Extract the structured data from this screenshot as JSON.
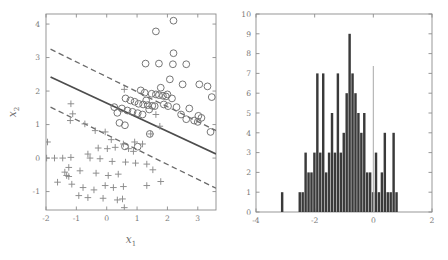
{
  "figure": {
    "background": "#ffffff",
    "panel_count": 2
  },
  "chart_data": [
    {
      "type": "scatter",
      "panel": "left",
      "title": "",
      "xlabel": "x1",
      "ylabel": "x2",
      "xlim": [
        -2,
        3.6
      ],
      "ylim": [
        -1.55,
        4.3
      ],
      "xticks": [
        -2,
        -1,
        0,
        1,
        2,
        3
      ],
      "xtick_labels": [
        "-2",
        "-1",
        "0",
        "1",
        "2",
        "3"
      ],
      "yticks": [
        -1,
        0,
        1,
        2,
        3,
        4
      ],
      "ytick_labels": [
        "-1",
        "0",
        "1",
        "2",
        "3",
        "4"
      ],
      "grid": false,
      "legend": null,
      "series": [
        {
          "name": "class-circle",
          "marker": "circle",
          "color": "#6f6f6f",
          "points": [
            [
              2.2,
              4.1
            ],
            [
              1.62,
              3.78
            ],
            [
              2.2,
              3.13
            ],
            [
              1.28,
              2.82
            ],
            [
              1.72,
              2.82
            ],
            [
              2.18,
              2.8
            ],
            [
              2.62,
              2.8
            ],
            [
              2.08,
              2.35
            ],
            [
              2.5,
              2.2
            ],
            [
              3.05,
              2.2
            ],
            [
              3.32,
              2.14
            ],
            [
              1.78,
              2.1
            ],
            [
              1.12,
              2.02
            ],
            [
              1.25,
              1.95
            ],
            [
              1.48,
              1.92
            ],
            [
              1.62,
              1.9
            ],
            [
              1.72,
              1.88
            ],
            [
              1.85,
              1.86
            ],
            [
              1.95,
              1.84
            ],
            [
              2.0,
              1.9
            ],
            [
              3.46,
              1.82
            ],
            [
              0.62,
              1.78
            ],
            [
              0.78,
              1.72
            ],
            [
              0.92,
              1.68
            ],
            [
              1.05,
              1.62
            ],
            [
              1.2,
              1.6
            ],
            [
              1.35,
              1.58
            ],
            [
              1.5,
              1.56
            ],
            [
              2.3,
              1.52
            ],
            [
              2.72,
              1.48
            ],
            [
              0.5,
              1.48
            ],
            [
              0.68,
              1.42
            ],
            [
              0.85,
              1.38
            ],
            [
              1.02,
              1.34
            ],
            [
              1.18,
              1.3
            ],
            [
              2.45,
              1.3
            ],
            [
              3.02,
              1.26
            ],
            [
              3.12,
              1.2
            ],
            [
              2.62,
              1.16
            ],
            [
              2.88,
              1.12
            ],
            [
              3.0,
              1.08
            ],
            [
              0.42,
              1.05
            ],
            [
              0.6,
              0.98
            ],
            [
              3.42,
              0.78
            ],
            [
              1.42,
              0.72
            ],
            [
              0.6,
              0.35
            ],
            [
              1.02,
              0.34
            ],
            [
              0.25,
              1.52
            ],
            [
              0.35,
              1.35
            ],
            [
              1.58,
              1.55
            ],
            [
              1.88,
              1.6
            ],
            [
              2.02,
              1.55
            ],
            [
              2.15,
              1.78
            ],
            [
              1.4,
              1.45
            ],
            [
              1.3,
              1.72
            ]
          ]
        },
        {
          "name": "class-plus",
          "marker": "plus",
          "color": "#8a8a8a",
          "points": [
            [
              0.58,
              2.05
            ],
            [
              -1.18,
              1.62
            ],
            [
              -1.12,
              1.32
            ],
            [
              -1.2,
              1.12
            ],
            [
              -0.72,
              1.02
            ],
            [
              -0.38,
              0.82
            ],
            [
              -0.05,
              0.78
            ],
            [
              1.62,
              1.3
            ],
            [
              1.75,
              0.95
            ],
            [
              1.45,
              0.72
            ],
            [
              -1.95,
              0.48
            ],
            [
              -1.98,
              0.0
            ],
            [
              -1.72,
              0.0
            ],
            [
              -1.45,
              0.0
            ],
            [
              -1.18,
              0.02
            ],
            [
              -0.62,
              0.12
            ],
            [
              -0.28,
              0.3
            ],
            [
              0.02,
              0.28
            ],
            [
              0.28,
              0.32
            ],
            [
              0.55,
              0.42
            ],
            [
              0.72,
              0.28
            ],
            [
              0.88,
              0.2
            ],
            [
              -0.55,
              0.0
            ],
            [
              -0.22,
              -0.02
            ],
            [
              0.18,
              -0.1
            ],
            [
              0.62,
              -0.12
            ],
            [
              0.95,
              -0.15
            ],
            [
              1.32,
              -0.18
            ],
            [
              1.52,
              -0.35
            ],
            [
              -1.38,
              -0.42
            ],
            [
              -1.32,
              -0.52
            ],
            [
              -1.25,
              -0.55
            ],
            [
              -0.88,
              -0.38
            ],
            [
              -0.35,
              -0.45
            ],
            [
              0.05,
              -0.52
            ],
            [
              0.38,
              -0.48
            ],
            [
              -1.62,
              -0.72
            ],
            [
              -1.15,
              -0.78
            ],
            [
              -0.78,
              -0.88
            ],
            [
              -0.42,
              -0.95
            ],
            [
              -0.05,
              -0.82
            ],
            [
              0.22,
              -0.88
            ],
            [
              0.55,
              -0.85
            ],
            [
              1.32,
              -0.82
            ],
            [
              1.78,
              -0.7
            ],
            [
              -0.92,
              -1.12
            ],
            [
              -0.62,
              -1.18
            ],
            [
              -0.12,
              -1.2
            ],
            [
              0.35,
              -1.25
            ],
            [
              0.52,
              -1.22
            ],
            [
              0.58,
              -1.48
            ],
            [
              -1.25,
              -0.28
            ],
            [
              0.15,
              0.55
            ],
            [
              0.92,
              0.48
            ],
            [
              1.18,
              0.42
            ]
          ]
        }
      ],
      "lines": [
        {
          "name": "decision-boundary",
          "style": "solid",
          "color": "#4d4d4d",
          "from": [
            -1.85,
            2.42
          ],
          "to": [
            3.6,
            0.12
          ]
        },
        {
          "name": "upper-margin",
          "style": "dashed",
          "color": "#6a6a6a",
          "from": [
            -1.85,
            3.25
          ],
          "to": [
            3.6,
            0.82
          ]
        },
        {
          "name": "lower-margin",
          "style": "dashed",
          "color": "#6a6a6a",
          "from": [
            -1.85,
            1.52
          ],
          "to": [
            3.6,
            -0.9
          ]
        }
      ]
    },
    {
      "type": "bar",
      "subtype": "histogram",
      "panel": "right",
      "title": "",
      "xlabel": "",
      "ylabel": "",
      "xlim": [
        -4,
        2
      ],
      "ylim": [
        0,
        10
      ],
      "xticks": [
        -4,
        -2,
        0,
        2
      ],
      "xtick_labels": [
        "-4",
        "-2",
        "0",
        "2"
      ],
      "yticks": [
        0,
        1,
        2,
        3,
        4,
        5,
        6,
        7,
        8,
        9,
        10
      ],
      "ytick_labels": [
        "0",
        "1",
        "2",
        "3",
        "4",
        "5",
        "6",
        "7",
        "8",
        "9",
        "10"
      ],
      "grid": false,
      "legend": null,
      "bin_width": 0.1,
      "bar_color": "#3a3a3a",
      "bin_starts": [
        -3.15,
        -2.55,
        -2.45,
        -2.35,
        -2.25,
        -2.15,
        -2.05,
        -1.95,
        -1.85,
        -1.75,
        -1.65,
        -1.55,
        -1.45,
        -1.35,
        -1.25,
        -1.15,
        -1.05,
        -0.95,
        -0.85,
        -0.75,
        -0.65,
        -0.55,
        -0.45,
        -0.35,
        -0.25,
        -0.15,
        -0.05,
        0.05,
        0.15,
        0.25,
        0.35,
        0.45,
        0.55,
        0.65,
        0.75
      ],
      "values": [
        1,
        1,
        1,
        3,
        2,
        2,
        3,
        7,
        3,
        7,
        2,
        3,
        5,
        3,
        7,
        3,
        4,
        6,
        9,
        7,
        6,
        5,
        4,
        5,
        2,
        2,
        1,
        3,
        1,
        2,
        4,
        1,
        1,
        4,
        1
      ],
      "reference_lines": [
        {
          "name": "zero-line",
          "orientation": "vertical",
          "value": 0,
          "color": "#b0b0b0"
        }
      ]
    }
  ]
}
